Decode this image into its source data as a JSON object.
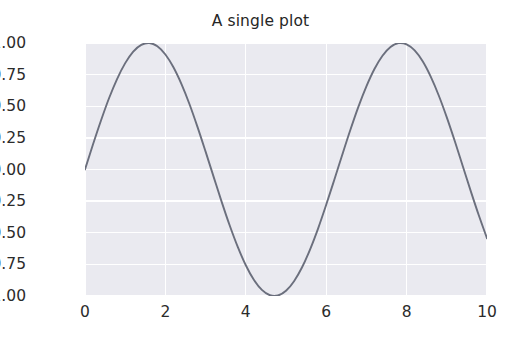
{
  "chart_data": {
    "type": "line",
    "title": "A single plot",
    "xlabel": "",
    "ylabel": "",
    "xlim": [
      0,
      10
    ],
    "ylim": [
      -1.0,
      1.0
    ],
    "grid": true,
    "legend": false,
    "style": "seaborn-darkgrid",
    "line_color": "#6b6f7d",
    "axes_facecolor": "#eaeaf0",
    "gridline_color": "#ffffff",
    "figure_facecolor": "#ffffff",
    "xticks": [
      0,
      2,
      4,
      6,
      8,
      10
    ],
    "xtick_labels": [
      "0",
      "2",
      "4",
      "6",
      "8",
      "10"
    ],
    "yticks": [
      1.0,
      0.75,
      0.5,
      0.25,
      0.0,
      -0.25,
      -0.5,
      -0.75,
      -1.0
    ],
    "ytick_labels": [
      "1.00",
      "0.75",
      "0.50",
      "0.25",
      "0.00",
      "−0.25",
      "−0.50",
      "−0.75",
      "−1.00"
    ],
    "series": [
      {
        "name": "sin(x)",
        "x": [
          0.0,
          0.2,
          0.4,
          0.6,
          0.8,
          1.0,
          1.2,
          1.4,
          1.6,
          1.8,
          2.0,
          2.2,
          2.4,
          2.6,
          2.8,
          3.0,
          3.2,
          3.4,
          3.6,
          3.8,
          4.0,
          4.2,
          4.4,
          4.6,
          4.8,
          5.0,
          5.2,
          5.4,
          5.6,
          5.8,
          6.0,
          6.2,
          6.4,
          6.6,
          6.8,
          7.0,
          7.2,
          7.4,
          7.6,
          7.8,
          8.0,
          8.2,
          8.4,
          8.6,
          8.8,
          9.0,
          9.2,
          9.4,
          9.6,
          9.8,
          10.0
        ],
        "y": [
          0.0,
          0.199,
          0.389,
          0.565,
          0.717,
          0.841,
          0.932,
          0.985,
          1.0,
          0.974,
          0.909,
          0.808,
          0.675,
          0.516,
          0.335,
          0.141,
          -0.058,
          -0.256,
          -0.443,
          -0.612,
          -0.757,
          -0.872,
          -0.952,
          -0.994,
          -0.996,
          -0.959,
          -0.883,
          -0.773,
          -0.631,
          -0.465,
          -0.279,
          -0.083,
          0.117,
          0.312,
          0.495,
          0.657,
          0.794,
          0.899,
          0.968,
          0.999,
          0.989,
          0.941,
          0.855,
          0.734,
          0.585,
          0.412,
          0.223,
          0.024,
          -0.175,
          -0.366,
          -0.544
        ]
      }
    ]
  }
}
